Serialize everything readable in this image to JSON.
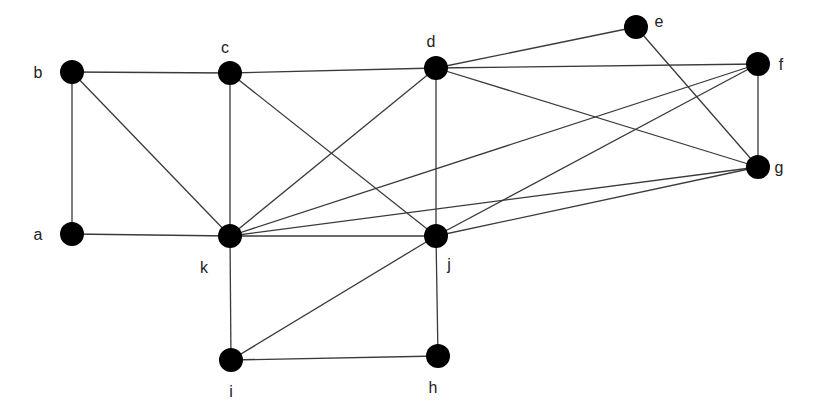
{
  "diagram": {
    "type": "undirected-graph",
    "node_color": "#000000",
    "edge_color": "#3a3a3a",
    "nodes": [
      {
        "id": "a",
        "label": "a",
        "x": 72,
        "y": 234,
        "lx": 38,
        "ly": 240
      },
      {
        "id": "b",
        "label": "b",
        "x": 72,
        "y": 72,
        "lx": 38,
        "ly": 78
      },
      {
        "id": "c",
        "label": "c",
        "x": 230,
        "y": 73,
        "lx": 225,
        "ly": 53
      },
      {
        "id": "d",
        "label": "d",
        "x": 436,
        "y": 68,
        "lx": 431,
        "ly": 47
      },
      {
        "id": "e",
        "label": "e",
        "x": 636,
        "y": 27,
        "lx": 659,
        "ly": 27
      },
      {
        "id": "f",
        "label": "f",
        "x": 758,
        "y": 64,
        "lx": 781,
        "ly": 70
      },
      {
        "id": "g",
        "label": "g",
        "x": 758,
        "y": 167,
        "lx": 779,
        "ly": 173
      },
      {
        "id": "h",
        "label": "h",
        "x": 438,
        "y": 356,
        "lx": 433,
        "ly": 393
      },
      {
        "id": "i",
        "label": "i",
        "x": 231,
        "y": 360,
        "lx": 231,
        "ly": 397
      },
      {
        "id": "j",
        "label": "j",
        "x": 436,
        "y": 236,
        "lx": 449,
        "ly": 270
      },
      {
        "id": "k",
        "label": "k",
        "x": 230,
        "y": 236,
        "lx": 204,
        "ly": 273
      }
    ],
    "edges": [
      [
        "a",
        "b"
      ],
      [
        "a",
        "k"
      ],
      [
        "b",
        "c"
      ],
      [
        "b",
        "k"
      ],
      [
        "c",
        "d"
      ],
      [
        "c",
        "k"
      ],
      [
        "c",
        "j"
      ],
      [
        "d",
        "e"
      ],
      [
        "d",
        "f"
      ],
      [
        "d",
        "g"
      ],
      [
        "d",
        "j"
      ],
      [
        "d",
        "k"
      ],
      [
        "e",
        "g"
      ],
      [
        "f",
        "g"
      ],
      [
        "f",
        "k"
      ],
      [
        "f",
        "j"
      ],
      [
        "g",
        "k"
      ],
      [
        "g",
        "j"
      ],
      [
        "k",
        "j"
      ],
      [
        "k",
        "i"
      ],
      [
        "j",
        "i"
      ],
      [
        "j",
        "h"
      ],
      [
        "i",
        "h"
      ]
    ]
  }
}
